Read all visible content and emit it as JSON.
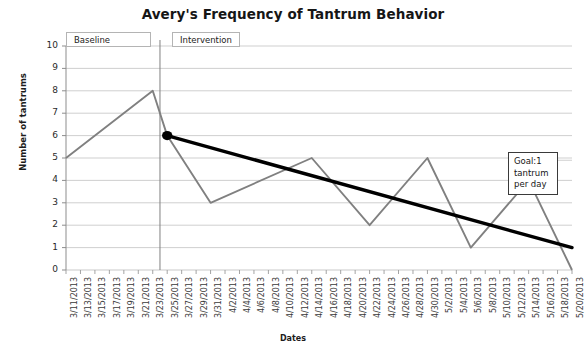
{
  "chart_data": {
    "type": "line",
    "title": "Avery's Frequency of Tantrum Behavior",
    "xlabel": "Dates",
    "ylabel": "Number of tantrums",
    "ylim": [
      0,
      10
    ],
    "ytick_step": 1,
    "grid": true,
    "legend": "none",
    "categories": [
      "3/11/2013",
      "3/13/2013",
      "3/15/2013",
      "3/17/2013",
      "3/19/2013",
      "3/21/2013",
      "3/23/2013",
      "3/25/2013",
      "3/27/2013",
      "3/29/2013",
      "3/31/2013",
      "4/2/2013",
      "4/4/2013",
      "4/6/2013",
      "4/8/2013",
      "4/10/2013",
      "4/12/2013",
      "4/14/2013",
      "4/16/2013",
      "4/18/2013",
      "4/20/2013",
      "4/22/2013",
      "4/24/2013",
      "4/26/2013",
      "4/28/2013",
      "4/30/2013",
      "5/2/2013",
      "5/4/2013",
      "5/6/2013",
      "5/8/2013",
      "5/10/2013",
      "5/12/2013",
      "5/14/2013",
      "5/16/2013",
      "5/18/2013",
      "5/20/2013"
    ],
    "series": [
      {
        "name": "Tantrums per day",
        "color": "#808080",
        "values": [
          5,
          null,
          null,
          null,
          null,
          null,
          8,
          6,
          null,
          null,
          3,
          null,
          null,
          null,
          null,
          null,
          null,
          5,
          null,
          null,
          null,
          2,
          null,
          null,
          null,
          5,
          null,
          null,
          1,
          null,
          null,
          null,
          4,
          null,
          null,
          0
        ]
      },
      {
        "name": "Trend line",
        "color": "#000000",
        "type": "trend",
        "start": {
          "x": "3/25/2013",
          "y": 6
        },
        "end": {
          "x": "5/20/2013",
          "y": 1
        }
      }
    ],
    "markers": [
      {
        "name": "intervention-start-marker",
        "x": "3/25/2013",
        "y": 6,
        "color": "#000000"
      }
    ],
    "phase_line": {
      "between": [
        "3/23/2013",
        "3/25/2013"
      ],
      "color": "#808080"
    },
    "ytick_labels": [
      "10",
      "9",
      "8",
      "7",
      "6",
      "5",
      "4",
      "3",
      "2",
      "1",
      "0"
    ]
  },
  "annotations": {
    "baseline_label": "Baseline",
    "intervention_label": "Intervention",
    "goal_box": "Goal:1\ntantrum\nper day"
  }
}
